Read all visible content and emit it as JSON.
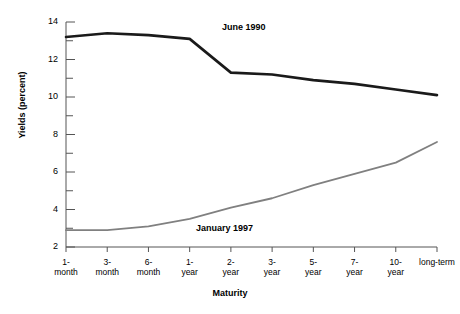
{
  "chart_data": {
    "type": "line",
    "title": "",
    "xlabel": "Maturity",
    "ylabel": "Yields (percent)",
    "categories": [
      "1-\nmonth",
      "3-\nmonth",
      "6-\nmonth",
      "1-\nyear",
      "2-\nyear",
      "3-\nyear",
      "5-\nyear",
      "7-\nyear",
      "10-\nyear",
      "long-term"
    ],
    "category_labels": [
      {
        "line1": "1-",
        "line2": "month"
      },
      {
        "line1": "3-",
        "line2": "month"
      },
      {
        "line1": "6-",
        "line2": "month"
      },
      {
        "line1": "1-",
        "line2": "year"
      },
      {
        "line1": "2-",
        "line2": "year"
      },
      {
        "line1": "3-",
        "line2": "year"
      },
      {
        "line1": "5-",
        "line2": "year"
      },
      {
        "line1": "7-",
        "line2": "year"
      },
      {
        "line1": "10-",
        "line2": "year"
      },
      {
        "line1": "long-term",
        "line2": ""
      }
    ],
    "ylim": [
      2,
      14
    ],
    "ytick_labels": [
      "14",
      "12",
      "10",
      "8",
      "6",
      "4",
      "2"
    ],
    "ytick_values": [
      14,
      12,
      10,
      8,
      6,
      4,
      2
    ],
    "yminor_values": [
      13,
      11,
      9,
      7,
      5,
      3
    ],
    "grid": false,
    "legend_position": "inline-annotation",
    "series": [
      {
        "name": "June 1990",
        "color": "#1a1a1a",
        "values": [
          13.2,
          13.4,
          13.3,
          13.1,
          11.3,
          11.2,
          10.9,
          10.7,
          10.4,
          10.1
        ]
      },
      {
        "name": "January 1997",
        "color": "#808080",
        "values": [
          2.9,
          2.9,
          3.1,
          3.5,
          4.1,
          4.6,
          5.3,
          5.9,
          6.5,
          7.6
        ]
      }
    ],
    "annotations": [
      {
        "text": "June 1990",
        "series": "June 1990"
      },
      {
        "text": "January 1997",
        "series": "January 1997"
      }
    ]
  }
}
